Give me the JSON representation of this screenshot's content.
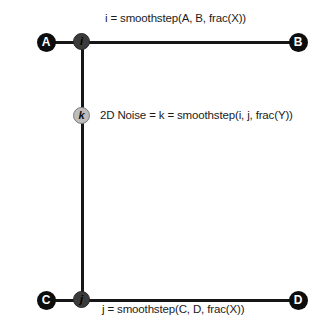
{
  "diagram": {
    "background_color": "#ffffff",
    "line_color": "#161616",
    "corner_node_color": "#0d0d0d",
    "mid_node_color": "#3b3b3b",
    "center_node_color": "#bdbdbd",
    "nodes": {
      "a": "A",
      "b": "B",
      "c": "C",
      "d": "D",
      "i": "i",
      "j": "j",
      "k": "k"
    },
    "labels": {
      "top": "i = smoothstep(A, B, frac(X))",
      "middle": "2D Noise = k = smoothstep(i, j, frac(Y))",
      "bottom": "j = smoothstep(C, D, frac(X))"
    },
    "artifact": ""
  }
}
